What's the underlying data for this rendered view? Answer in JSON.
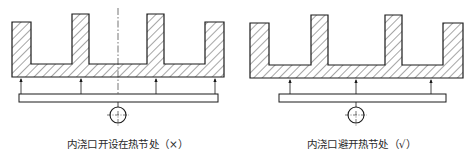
{
  "diagrams": [
    {
      "id": "left",
      "caption": "内浇口开设在热节处（×）",
      "verdict": "incorrect",
      "verdict_symbol": "×",
      "casting": {
        "outer_left": 12,
        "outer_right": 224,
        "floor_y": 64,
        "bottom_y": 77,
        "prongs": [
          {
            "x1": 12,
            "x2": 31,
            "top": 22
          },
          {
            "x1": 72,
            "x2": 89,
            "top": 14
          },
          {
            "x1": 147,
            "x2": 164,
            "top": 14
          },
          {
            "x1": 205,
            "x2": 224,
            "top": 22
          }
        ]
      },
      "gates_x": [
        21,
        81,
        156,
        215
      ],
      "runner": {
        "x1": 19,
        "x2": 218,
        "y1": 94,
        "y2": 102
      },
      "sprue": {
        "cx": 118,
        "cy": 115,
        "r": 8
      },
      "centerline": true
    },
    {
      "id": "right",
      "caption": "内浇口避开热节处（√）",
      "verdict": "correct",
      "verdict_symbol": "√",
      "casting": {
        "outer_left": 250,
        "outer_right": 463,
        "floor_y": 65,
        "bottom_y": 78,
        "prongs": [
          {
            "x1": 250,
            "x2": 269,
            "top": 23
          },
          {
            "x1": 311,
            "x2": 328,
            "top": 15
          },
          {
            "x1": 385,
            "x2": 402,
            "top": 15
          },
          {
            "x1": 443,
            "x2": 463,
            "top": 23
          }
        ]
      },
      "gates_x": [
        290,
        356,
        431
      ],
      "runner": {
        "x1": 279,
        "x2": 446,
        "y1": 94,
        "y2": 102
      },
      "sprue": {
        "cx": 356,
        "cy": 115,
        "r": 8
      },
      "centerline": false
    }
  ],
  "colors": {
    "line": "#1a1a1a",
    "hatch": "#3a3a3a",
    "background": "#ffffff",
    "text": "#2a2a2a"
  }
}
